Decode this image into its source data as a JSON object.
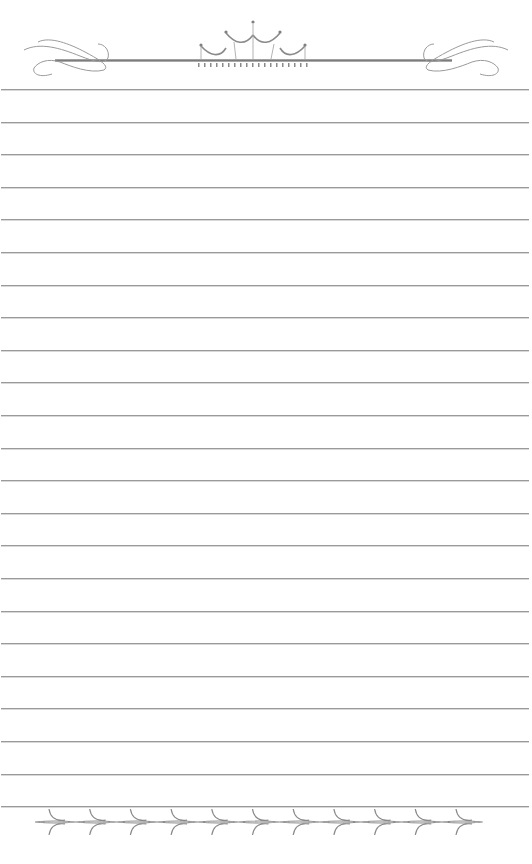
{
  "page": {
    "type": "lined-stationery",
    "background": "#ffffff",
    "line_color": "#9a9a9a",
    "ornament_color": "#7a7a7a",
    "line_count": 23,
    "first_line_y": 89,
    "line_spacing": 32.6
  },
  "header": {
    "ornament": "crown-with-flourishes-icon"
  },
  "footer": {
    "ornament": "diamond-chain-border-icon",
    "diamond_count": 11
  }
}
